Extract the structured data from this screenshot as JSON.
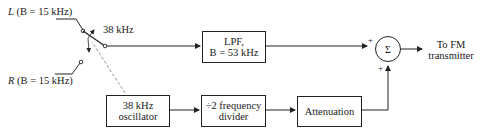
{
  "inputs": {
    "left": {
      "var": "L",
      "cond": "(B = 15 kHz)",
      "label": "L (B = 15 kHz)"
    },
    "right": {
      "var": "R",
      "cond": "(B = 15 kHz)",
      "label": "R (B = 15 kHz)"
    }
  },
  "switch": {
    "rate_label": "38 kHz"
  },
  "blocks": {
    "lpf": {
      "line1": "LPF,",
      "line2": "B = 53 kHz"
    },
    "oscillator": {
      "line1": "38 kHz",
      "line2": "oscillator"
    },
    "divider": {
      "line1": "÷2 frequency",
      "line2": "divider"
    },
    "attenuation": {
      "line1": "Attenuation"
    }
  },
  "summer": {
    "symbol": "Σ",
    "sign_top": "+",
    "sign_bottom": "+"
  },
  "output": {
    "line1": "To FM",
    "line2": "transmitter"
  },
  "colors": {
    "line": "#222222",
    "dashed": "#777777",
    "background": "#ffffff"
  }
}
